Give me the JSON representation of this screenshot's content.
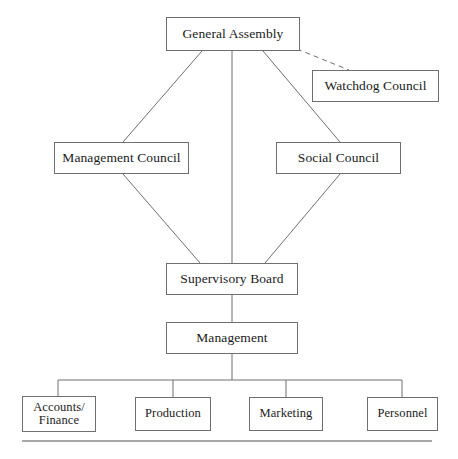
{
  "diagram": {
    "background_color": "#ffffff",
    "line_color": "#6f6f6f",
    "text_color": "#1a1a1a",
    "nodes": {
      "general_assembly": "General Assembly",
      "watchdog_council": "Watchdog Council",
      "management_council": "Management Council",
      "social_council": "Social Council",
      "supervisory_board": "Supervisory Board",
      "management": "Management",
      "accounts_finance": "Accounts/\nFinance",
      "production": "Production",
      "marketing": "Marketing",
      "personnel": "Personnel"
    },
    "edges": [
      {
        "name": "general-assembly-to-management-council",
        "style": "solid"
      },
      {
        "name": "general-assembly-to-supervisory-board",
        "style": "solid"
      },
      {
        "name": "general-assembly-to-social-council",
        "style": "solid"
      },
      {
        "name": "general-assembly-to-watchdog-council",
        "style": "dashed"
      },
      {
        "name": "management-council-to-supervisory-board",
        "style": "solid"
      },
      {
        "name": "social-council-to-supervisory-board",
        "style": "solid"
      },
      {
        "name": "supervisory-board-to-management",
        "style": "solid"
      },
      {
        "name": "management-to-departments-bus",
        "style": "solid"
      },
      {
        "name": "bus-to-accounts-finance",
        "style": "solid"
      },
      {
        "name": "bus-to-production",
        "style": "solid"
      },
      {
        "name": "bus-to-marketing",
        "style": "solid"
      },
      {
        "name": "bus-to-personnel",
        "style": "solid"
      }
    ],
    "footer_rule": "horizontal-rule"
  }
}
